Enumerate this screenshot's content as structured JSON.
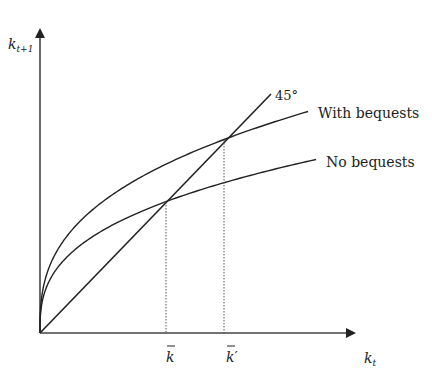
{
  "chart_data": {
    "type": "line",
    "title": "",
    "xlabel": "k_t",
    "ylabel": "k_{t+1}",
    "origin_px": [
      40,
      333
    ],
    "series": [
      {
        "name": "45°",
        "kind": "line",
        "from_px": [
          40,
          333
        ],
        "to_px": [
          271,
          94
        ]
      },
      {
        "name": "With bequests",
        "kind": "concave",
        "a": 29.6,
        "b": 0.36,
        "x_end_rel": 268
      },
      {
        "name": "No bequests",
        "kind": "concave",
        "a": 23.6,
        "b": 0.355,
        "x_end_rel": 276
      }
    ],
    "steady_states": [
      {
        "label": "k̄",
        "x_px": 166,
        "y_px": 202
      },
      {
        "label": "k̄′",
        "x_px": 224,
        "y_px": 140
      }
    ],
    "grid": false,
    "legend": "inline labels"
  },
  "labels": {
    "y_axis_main": "k",
    "y_axis_sub": "t+1",
    "x_axis_main": "k",
    "x_axis_sub": "t",
    "line_45": "45°",
    "with_bequests": "With bequests",
    "no_bequests": "No bequests",
    "kbar": "k",
    "kbar_prime": "k",
    "prime": "′"
  },
  "colors": {
    "ink": "#222222",
    "axis": "#444444"
  }
}
